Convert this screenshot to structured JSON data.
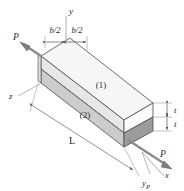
{
  "figure": {
    "background_color": "#ffffff",
    "line_color": "#3a3a3a",
    "axes": {
      "y_label": "y",
      "z_label": "z",
      "x_label": "x",
      "yp_label": "y",
      "yp_subscript": "P"
    },
    "loads": [
      {
        "name": "force-left",
        "label": "P",
        "direction": "up-left"
      },
      {
        "name": "force-right",
        "label": "P",
        "direction": "down-right"
      }
    ],
    "dimensions": [
      {
        "name": "half-width-left",
        "label": "b/2"
      },
      {
        "name": "half-width-right",
        "label": "b/2"
      },
      {
        "name": "thickness-top",
        "label": "t"
      },
      {
        "name": "thickness-bottom",
        "label": "t"
      },
      {
        "name": "length",
        "label": "L"
      }
    ],
    "layers": [
      {
        "name": "layer-one",
        "label": "(1)",
        "fill": "#efefef"
      },
      {
        "name": "layer-two",
        "label": "(2)",
        "fill": "#c9c9c9"
      }
    ],
    "colors": {
      "top_face": "#f4f4f4",
      "front_upper": "#e9e9e9",
      "front_lower": "#cfcfcf",
      "end_upper": "#fbfbfb",
      "end_lower": "#9e9e9e",
      "arrow_fill": "#8c8c8c",
      "dimension_line": "#6a6a6a"
    }
  }
}
